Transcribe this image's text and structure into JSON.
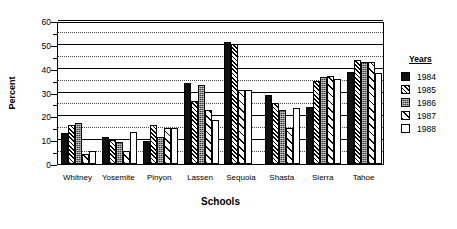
{
  "chart_data": {
    "type": "bar",
    "title": "",
    "xlabel": "Schools",
    "ylabel": "Percent",
    "ylim": [
      0,
      60
    ],
    "yticks": [
      0,
      10,
      20,
      30,
      40,
      50,
      60
    ],
    "ytick_minor": [
      5,
      15,
      25,
      35,
      45,
      55
    ],
    "grid": true,
    "legend_title": "Years",
    "legend_position": "right",
    "categories": [
      "Whitney",
      "Yosemite",
      "Pinyon",
      "Lassen",
      "Sequoia",
      "Shasta",
      "Sierra",
      "Tahoe"
    ],
    "series": [
      {
        "name": "1984",
        "pattern": "solid-black",
        "values": [
          13.0,
          11.3,
          9.5,
          34.0,
          51.0,
          29.0,
          24.0,
          38.5
        ]
      },
      {
        "name": "1985",
        "pattern": "dense-hatch",
        "values": [
          16.3,
          10.0,
          16.3,
          26.5,
          50.5,
          25.5,
          35.0,
          43.5
        ]
      },
      {
        "name": "1986",
        "pattern": "dark-stipple",
        "values": [
          17.0,
          9.3,
          11.2,
          33.0,
          0.0,
          22.5,
          36.5,
          43.0
        ]
      },
      {
        "name": "1987",
        "pattern": "sparse-hatch",
        "values": [
          4.3,
          5.5,
          15.3,
          22.5,
          31.0,
          15.0,
          37.0,
          43.0
        ]
      },
      {
        "name": "1988",
        "pattern": "white-empty",
        "values": [
          5.5,
          13.3,
          15.3,
          18.5,
          31.0,
          23.5,
          35.5,
          38.0
        ]
      }
    ]
  },
  "axis": {
    "y_title": "Percent",
    "x_title": "Schools"
  },
  "legend": {
    "title": "Years",
    "items": [
      {
        "label": "1984"
      },
      {
        "label": "1985"
      },
      {
        "label": "1986"
      },
      {
        "label": "1987"
      },
      {
        "label": "1988"
      }
    ]
  }
}
